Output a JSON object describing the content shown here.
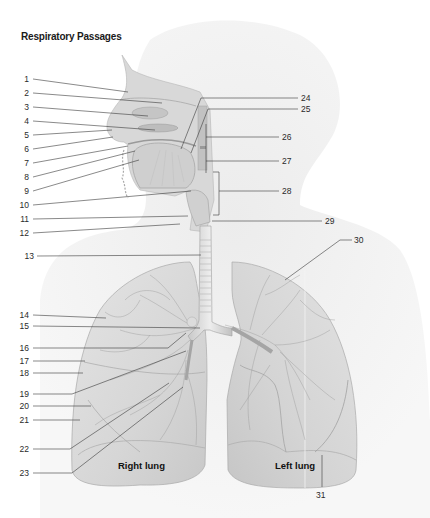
{
  "title": "Respiratory Passages",
  "lung_labels": {
    "right": "Right lung",
    "left": "Left lung"
  },
  "labels_left": [
    {
      "n": "1",
      "x": 13,
      "y": 74,
      "tx": 128,
      "ty": 92
    },
    {
      "n": "2",
      "x": 13,
      "y": 88,
      "tx": 162,
      "ty": 103
    },
    {
      "n": "3",
      "x": 13,
      "y": 102,
      "tx": 148,
      "ty": 116
    },
    {
      "n": "4",
      "x": 13,
      "y": 116,
      "tx": 155,
      "ty": 130
    },
    {
      "n": "5",
      "x": 13,
      "y": 130,
      "tx": 112,
      "ty": 130
    },
    {
      "n": "6",
      "x": 13,
      "y": 144,
      "tx": 113,
      "ty": 137
    },
    {
      "n": "7",
      "x": 13,
      "y": 158,
      "tx": 128,
      "ty": 146
    },
    {
      "n": "8",
      "x": 13,
      "y": 172,
      "tx": 135,
      "ty": 151
    },
    {
      "n": "9",
      "x": 13,
      "y": 186,
      "tx": 139,
      "ty": 160
    },
    {
      "n": "10",
      "x": 13,
      "y": 200,
      "tx": 191,
      "ty": 191
    },
    {
      "n": "11",
      "x": 13,
      "y": 214,
      "tx": 188,
      "ty": 216
    },
    {
      "n": "12",
      "x": 13,
      "y": 228,
      "tx": 180,
      "ty": 224
    },
    {
      "n": "13",
      "x": 23,
      "y": 255,
      "tx": 201,
      "ty": 255
    },
    {
      "n": "14",
      "x": 13,
      "y": 315,
      "tx": 106,
      "ty": 318
    },
    {
      "n": "15",
      "x": 13,
      "y": 326,
      "tx": 200,
      "ty": 328
    },
    {
      "n": "16",
      "x": 13,
      "y": 348,
      "tx": 168,
      "ty": 348,
      "bx": 186,
      "by": 333
    },
    {
      "n": "17",
      "x": 13,
      "y": 361,
      "tx": 85,
      "ty": 361
    },
    {
      "n": "18",
      "x": 13,
      "y": 373,
      "tx": 83,
      "ty": 373
    },
    {
      "n": "19",
      "x": 13,
      "y": 394,
      "tx": 72,
      "ty": 394,
      "bx": 186,
      "by": 351
    },
    {
      "n": "20",
      "x": 13,
      "y": 406,
      "tx": 91,
      "ty": 406
    },
    {
      "n": "21",
      "x": 13,
      "y": 420,
      "tx": 80,
      "ty": 420
    },
    {
      "n": "22",
      "x": 13,
      "y": 449,
      "tx": 70,
      "ty": 449,
      "bx": 169,
      "by": 383
    },
    {
      "n": "23",
      "x": 13,
      "y": 473,
      "tx": 72,
      "ty": 473,
      "bx": 183,
      "by": 387
    }
  ],
  "labels_right": [
    {
      "n": "24",
      "x": 302,
      "y": 98,
      "fx": 201,
      "fy": 98
    },
    {
      "n": "25",
      "x": 302,
      "y": 109,
      "fx": 208,
      "fy": 109
    },
    {
      "n": "26",
      "x": 283,
      "y": 137,
      "fx": 206,
      "fy": 137
    },
    {
      "n": "27",
      "x": 283,
      "y": 161,
      "fx": 206,
      "fy": 161
    },
    {
      "n": "28",
      "x": 283,
      "y": 191,
      "fx": 219,
      "fy": 191
    },
    {
      "n": "29",
      "x": 326,
      "y": 221,
      "fx": 212,
      "fy": 221
    },
    {
      "n": "30",
      "x": 355,
      "y": 240,
      "fx": 340,
      "fy": 240
    },
    {
      "n": "31",
      "x": 318,
      "y": 497,
      "fx": 322,
      "fy": 455
    }
  ]
}
